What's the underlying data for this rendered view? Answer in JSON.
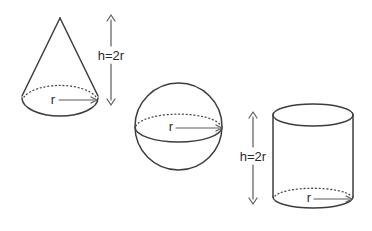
{
  "canvas": {
    "width": 372,
    "height": 231,
    "background": "#ffffff"
  },
  "colors": {
    "outline": "#3d3d3d",
    "dimension_arrow": "#5a5a5c",
    "label_text": "#2a2a2a"
  },
  "shapes": [
    {
      "id": "cone",
      "height_label": "h=2r",
      "radius_label": "r"
    },
    {
      "id": "sphere",
      "radius_label": "r"
    },
    {
      "id": "cylinder",
      "height_label": "h=2r",
      "radius_label": "r"
    }
  ]
}
